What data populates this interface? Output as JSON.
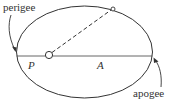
{
  "diagram": {
    "type": "orbit-ellipse",
    "labels": {
      "perigee": "perigee",
      "apogee": "apogee",
      "perigee_distance": "P",
      "apogee_distance": "A"
    },
    "colors": {
      "stroke": "#333333",
      "background": "#ffffff"
    }
  }
}
